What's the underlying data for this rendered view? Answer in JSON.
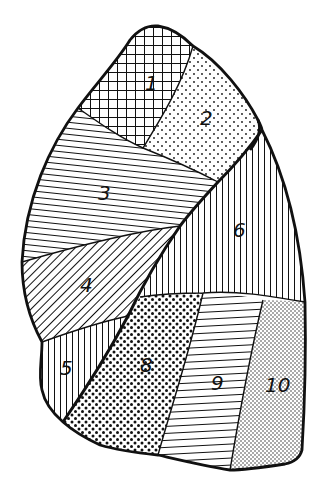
{
  "diagram": {
    "ink_color": "#111111",
    "background": "#ffffff",
    "segments": [
      {
        "id": "1",
        "label": "1",
        "pattern": "crosshatch"
      },
      {
        "id": "2",
        "label": "2",
        "pattern": "sparse-dots"
      },
      {
        "id": "3",
        "label": "3",
        "pattern": "horizontal-lines"
      },
      {
        "id": "4",
        "label": "4",
        "pattern": "diagonal-lines"
      },
      {
        "id": "5",
        "label": "5",
        "pattern": "vertical-lines"
      },
      {
        "id": "6",
        "label": "6",
        "pattern": "vertical-lines"
      },
      {
        "id": "8",
        "label": "8",
        "pattern": "coarse-dots"
      },
      {
        "id": "9",
        "label": "9",
        "pattern": "horizontal-lines"
      },
      {
        "id": "10",
        "label": "10",
        "pattern": "fine-dots"
      }
    ]
  }
}
